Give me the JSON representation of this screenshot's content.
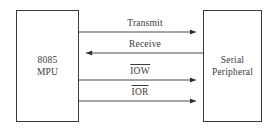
{
  "diagram": {
    "type": "block-diagram",
    "background_color": "#ffffff",
    "line_color": "#3a3a3a",
    "text_color": "#3c3c3c",
    "nodes": [
      {
        "id": "mpu",
        "line1": "8085",
        "line2": "MPU",
        "x": 16,
        "y": 10,
        "width": 63,
        "height": 112
      },
      {
        "id": "peripheral",
        "line1": "Serial",
        "line2": "Peripheral",
        "x": 203,
        "y": 10,
        "width": 59,
        "height": 112
      }
    ],
    "connections": [
      {
        "id": "transmit",
        "label": "Transmit",
        "overbar": false,
        "direction": "mpu-to-peripheral",
        "arrow": "right",
        "y": 32,
        "label_x": 145,
        "label_y": 18
      },
      {
        "id": "receive",
        "label": "Receive",
        "overbar": false,
        "direction": "peripheral-to-mpu",
        "arrow": "left",
        "y": 53,
        "label_x": 145,
        "label_y": 39
      },
      {
        "id": "iow",
        "label": "IOW",
        "overbar": true,
        "direction": "mpu-to-peripheral",
        "arrow": "right",
        "y": 80,
        "label_x": 140,
        "label_y": 64
      },
      {
        "id": "ior",
        "label": "IOR",
        "overbar": true,
        "direction": "mpu-to-peripheral",
        "arrow": "right",
        "y": 101,
        "label_x": 140,
        "label_y": 85
      }
    ]
  }
}
